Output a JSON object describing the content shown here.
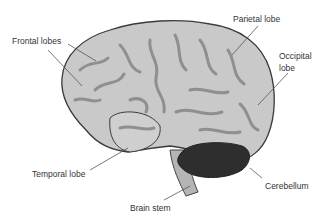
{
  "diagram": {
    "colors": {
      "cerebrum_fill": "#c9c9c9",
      "cerebrum_outline": "#3a3a3a",
      "sulci": "#8f8f8f",
      "cerebellum": "#2e2e2e",
      "brain_stem": "#b5b5b5",
      "leader_line": "#555555",
      "label_text": "#333333"
    },
    "labels": {
      "frontal": "Frontal lobes",
      "parietal": "Parietal lobe",
      "occipital_line1": "Occipital",
      "occipital_line2": "lobe",
      "temporal": "Temporal lobe",
      "cerebellum": "Cerebellum",
      "brain_stem": "Brain stem"
    }
  }
}
